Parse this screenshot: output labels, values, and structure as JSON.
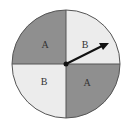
{
  "spinner": {
    "sectors": [
      {
        "position": "top-left",
        "label": "A",
        "color": "#8f8f8f"
      },
      {
        "position": "top-right",
        "label": "B",
        "color": "#ececec"
      },
      {
        "position": "bottom-left",
        "label": "B",
        "color": "#ececec"
      },
      {
        "position": "bottom-right",
        "label": "A",
        "color": "#8f8f8f"
      }
    ],
    "pointer": {
      "direction": "upper-right",
      "lands_on": "B"
    },
    "outline_color": "#555555"
  }
}
